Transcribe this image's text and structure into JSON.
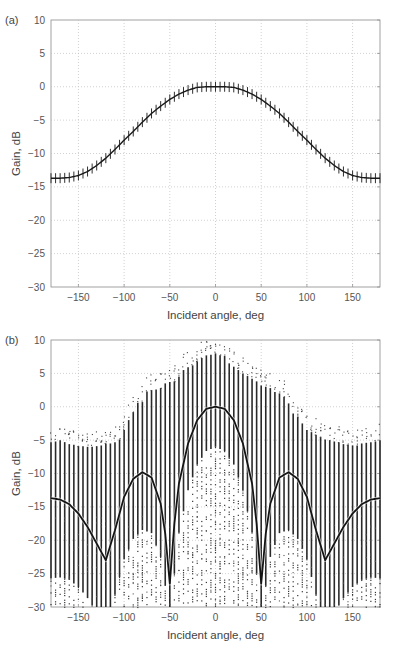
{
  "chart_data": [
    {
      "panel_label": "(a)",
      "type": "line",
      "title": "",
      "xlabel": "Incident angle, deg",
      "ylabel": "Gain, dB",
      "xlim": [
        -180,
        180
      ],
      "ylim": [
        -30,
        10
      ],
      "xticks": [
        -150,
        -100,
        -50,
        0,
        50,
        100,
        150
      ],
      "yticks": [
        10,
        5,
        0,
        -5,
        -10,
        -15,
        -20,
        -25,
        -30
      ],
      "grid": true,
      "markers": "vertical error-bar ticks every 5 deg",
      "series": [
        {
          "name": "gain",
          "x": [
            -180,
            -170,
            -160,
            -150,
            -140,
            -130,
            -120,
            -110,
            -100,
            -90,
            -80,
            -70,
            -60,
            -50,
            -40,
            -30,
            -20,
            -10,
            0,
            10,
            20,
            30,
            40,
            50,
            60,
            70,
            80,
            90,
            100,
            110,
            120,
            130,
            140,
            150,
            160,
            170,
            180
          ],
          "values": [
            -13.7,
            -13.7,
            -13.6,
            -13.3,
            -12.7,
            -11.8,
            -10.7,
            -9.4,
            -8.0,
            -6.7,
            -5.3,
            -4.0,
            -2.9,
            -1.9,
            -1.1,
            -0.5,
            -0.1,
            0.0,
            0.0,
            0.0,
            -0.1,
            -0.5,
            -1.1,
            -1.9,
            -2.9,
            -4.0,
            -5.3,
            -6.7,
            -8.0,
            -9.4,
            -10.7,
            -11.8,
            -12.7,
            -13.3,
            -13.6,
            -13.7,
            -13.7
          ]
        }
      ]
    },
    {
      "panel_label": "(b)",
      "type": "line",
      "title": "",
      "xlabel": "Incident angle, deg",
      "ylabel": "Gain, dB",
      "xlim": [
        -180,
        180
      ],
      "ylim": [
        -30,
        10
      ],
      "xticks": [
        -150,
        -100,
        -50,
        0,
        50,
        100,
        150
      ],
      "yticks": [
        10,
        5,
        0,
        -5,
        -10,
        -15,
        -20,
        -25,
        -30
      ],
      "grid": true,
      "series": [
        {
          "name": "mean gain",
          "x": [
            -180,
            -170,
            -160,
            -150,
            -140,
            -130,
            -120,
            -110,
            -100,
            -90,
            -80,
            -70,
            -60,
            -55,
            -50,
            -45,
            -40,
            -30,
            -20,
            -10,
            0,
            10,
            20,
            30,
            40,
            45,
            50,
            55,
            60,
            70,
            80,
            90,
            100,
            110,
            120,
            130,
            140,
            150,
            160,
            170,
            180
          ],
          "values": [
            -13.7,
            -13.9,
            -14.6,
            -16.0,
            -18.0,
            -20.5,
            -23.0,
            -18.5,
            -13.5,
            -10.8,
            -9.8,
            -10.6,
            -14.5,
            -19.0,
            -26.5,
            -17.5,
            -11.5,
            -5.5,
            -2.0,
            -0.3,
            0.0,
            -0.3,
            -2.0,
            -5.5,
            -11.5,
            -17.5,
            -26.5,
            -19.0,
            -14.5,
            -10.6,
            -9.8,
            -10.8,
            -13.5,
            -18.5,
            -23.0,
            -20.5,
            -18.0,
            -16.0,
            -14.6,
            -13.9,
            -13.7
          ]
        },
        {
          "name": "sample spread (vertical bars, top of range; bottom at -30)",
          "x": [
            -180,
            -175,
            -170,
            -165,
            -160,
            -155,
            -150,
            -145,
            -140,
            -135,
            -130,
            -125,
            -120,
            -115,
            -110,
            -105,
            -100,
            -95,
            -90,
            -85,
            -80,
            -75,
            -70,
            -65,
            -60,
            -55,
            -50,
            -45,
            -40,
            -35,
            -30,
            -25,
            -20,
            -15,
            -10,
            -5,
            0,
            5,
            10,
            15,
            20,
            25,
            30,
            35,
            40,
            45,
            50,
            55,
            60,
            65,
            70,
            75,
            80,
            85,
            90,
            95,
            100,
            105,
            110,
            115,
            120,
            125,
            130,
            135,
            140,
            145,
            150,
            155,
            160,
            165,
            170,
            175,
            180
          ],
          "values": [
            -5.3,
            -5.2,
            -5.0,
            -5.3,
            -5.6,
            -5.7,
            -5.9,
            -5.9,
            -6.0,
            -6.0,
            -5.9,
            -5.8,
            -5.5,
            -5.5,
            -5.3,
            -4.9,
            -3.5,
            -2.0,
            -0.8,
            0.6,
            0.7,
            2.3,
            2.5,
            2.6,
            2.8,
            3.5,
            3.7,
            3.8,
            4.5,
            5.5,
            5.9,
            6.2,
            6.8,
            7.3,
            7.7,
            7.8,
            8.0,
            7.7,
            7.6,
            6.5,
            6.0,
            5.5,
            5.0,
            4.6,
            4.2,
            3.8,
            3.2,
            3.0,
            2.8,
            2.2,
            2.0,
            1.5,
            0.5,
            -1.0,
            -1.5,
            -2.5,
            -3.5,
            -3.8,
            -4.2,
            -4.5,
            -4.9,
            -5.0,
            -5.2,
            -5.3,
            -5.6,
            -5.7,
            -5.8,
            -5.8,
            -5.5,
            -5.4,
            -5.3,
            -5.2,
            -5.0
          ]
        }
      ]
    }
  ]
}
